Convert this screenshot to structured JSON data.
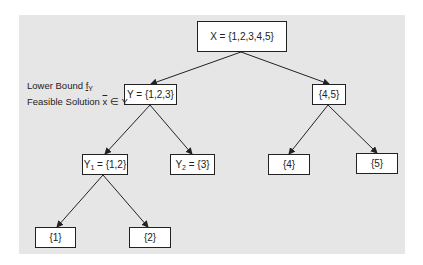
{
  "diagram": {
    "type": "branch-and-bound tree",
    "nodes": [
      {
        "id": "root",
        "label": "X = {1,2,3,4,5}"
      },
      {
        "id": "Y",
        "label": "Y = {1,2,3}"
      },
      {
        "id": "n45",
        "label": "{4,5}"
      },
      {
        "id": "Y1",
        "label_prefix": "Y",
        "label_sub": "1",
        "label_rest": " = {1,2}"
      },
      {
        "id": "Y2",
        "label_prefix": "Y",
        "label_sub": "2",
        "label_rest": " = {3}"
      },
      {
        "id": "n4",
        "label": "{4}"
      },
      {
        "id": "n5",
        "label": "{5}"
      },
      {
        "id": "n1",
        "label": "{1}"
      },
      {
        "id": "n2",
        "label": "{2}"
      }
    ],
    "edges": [
      [
        "root",
        "Y"
      ],
      [
        "root",
        "n45"
      ],
      [
        "Y",
        "Y1"
      ],
      [
        "Y",
        "Y2"
      ],
      [
        "n45",
        "n4"
      ],
      [
        "n45",
        "n5"
      ],
      [
        "Y1",
        "n1"
      ],
      [
        "Y1",
        "n2"
      ]
    ],
    "annotations": {
      "lower_bound_text": "Lower Bound ",
      "lower_bound_symbol": "f",
      "lower_bound_sub": "Y",
      "feasible_text": "Feasible Solution ",
      "feasible_symbol": "x",
      "feasible_rest": " ∈ Y"
    }
  },
  "colors": {
    "background": "#e6e6e6",
    "node_fill": "#ffffff",
    "stroke": "#222222"
  }
}
